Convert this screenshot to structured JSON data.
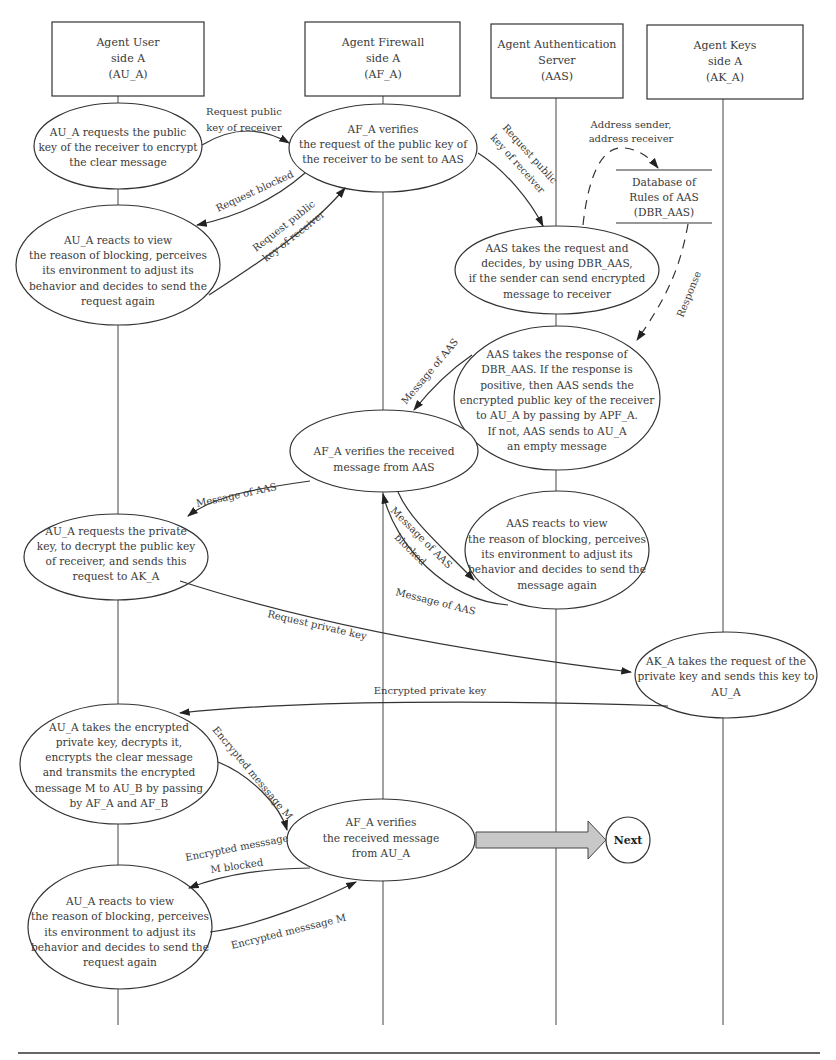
{
  "agents": [
    {
      "id": "AU_A",
      "lines": [
        "Agent User",
        "side A",
        "(AU_A)"
      ]
    },
    {
      "id": "AF_A",
      "lines": [
        "Agent Firewall",
        "side A",
        "(AF_A)"
      ]
    },
    {
      "id": "AAS",
      "lines": [
        "Agent Authentication",
        "Server",
        "(AAS)"
      ]
    },
    {
      "id": "AK_A",
      "lines": [
        "Agent Keys",
        "side A",
        "(AK_A)"
      ]
    }
  ],
  "database": {
    "lines": [
      "Database of",
      "Rules of AAS",
      "(DBR_AAS)"
    ],
    "input_label": [
      "Address sender,",
      "address receiver"
    ],
    "output_label": "Response"
  },
  "nodes": [
    {
      "id": "au_request_public_key",
      "lines": [
        "AU_A requests the public",
        "key of the receiver to encrypt",
        "the clear message"
      ]
    },
    {
      "id": "af_verify_request",
      "lines": [
        "AF_A verifies",
        "the request of the public key of",
        "the receiver to be sent to AAS"
      ]
    },
    {
      "id": "au_react_blocking_1",
      "lines": [
        "AU_A reacts to view",
        "the reason of blocking, perceives",
        "its environment to adjust its",
        "behavior and decides to send the",
        "request again"
      ]
    },
    {
      "id": "aas_take_request",
      "lines": [
        "AAS takes the request and",
        "decides, by using DBR_AAS,",
        "if the sender can send encrypted",
        "message to receiver"
      ]
    },
    {
      "id": "aas_take_response",
      "lines": [
        "AAS takes the response of",
        "DBR_AAS. If the response is",
        "positive, then AAS sends the",
        "encrypted public key of the receiver",
        "to AU_A by passing by APF_A.",
        "If not, AAS sends to AU_A",
        "an empty message"
      ]
    },
    {
      "id": "af_verify_aas_message",
      "lines": [
        "AF_A verifies the received",
        "message from AAS"
      ]
    },
    {
      "id": "au_request_private_key",
      "lines": [
        "AU_A requests the private",
        "key, to decrypt the public key",
        "of receiver, and sends this",
        "request to AK_A"
      ]
    },
    {
      "id": "aas_react_blocking",
      "lines": [
        "AAS reacts to view",
        "the reason of blocking, perceives",
        "its environment to adjust its",
        "behavior and decides to send the",
        "message again"
      ]
    },
    {
      "id": "ak_send_private_key",
      "lines": [
        "AK_A takes the request of the",
        "private key and sends this key to",
        "AU_A"
      ]
    },
    {
      "id": "au_encrypt_transmit",
      "lines": [
        "AU_A takes the encrypted",
        "private key, decrypts it,",
        "encrypts the clear message",
        "and transmits the encrypted",
        "message M to AU_B by passing",
        "by AF_A and AF_B"
      ]
    },
    {
      "id": "af_verify_au_message",
      "lines": [
        "AF_A verifies",
        "the received message",
        "from AU_A"
      ]
    },
    {
      "id": "au_react_blocking_2",
      "lines": [
        "AU_A reacts to view",
        "the reason of blocking, perceives",
        "its environment to adjust its",
        "behavior and decides to send the",
        "request again"
      ]
    }
  ],
  "edges": [
    {
      "id": "e1",
      "lines": [
        "Request public",
        "key of receiver"
      ]
    },
    {
      "id": "e2",
      "lines": [
        "Request blocked"
      ]
    },
    {
      "id": "e3",
      "lines": [
        "Request public",
        "key of receiver"
      ]
    },
    {
      "id": "e4",
      "lines": [
        "Request public",
        "key of receiver"
      ]
    },
    {
      "id": "e5",
      "lines": [
        "Message of AAS"
      ]
    },
    {
      "id": "e6",
      "lines": [
        "Message of AAS"
      ]
    },
    {
      "id": "e7",
      "lines": [
        "Message of AAS",
        "blocked"
      ]
    },
    {
      "id": "e8",
      "lines": [
        "Message of AAS"
      ]
    },
    {
      "id": "e9",
      "lines": [
        "Request private key"
      ]
    },
    {
      "id": "e10",
      "lines": [
        "Encrypted private key"
      ]
    },
    {
      "id": "e11",
      "lines": [
        "Encrypted messsage M"
      ]
    },
    {
      "id": "e12",
      "lines": [
        "Encrypted messsage",
        "M blocked"
      ]
    },
    {
      "id": "e13",
      "lines": [
        "Encrypted messsage M"
      ]
    }
  ],
  "next": {
    "label": "Next"
  },
  "colors": {
    "stroke": "#333333",
    "arrow_fill": "#c8c8c8",
    "text": "#3a3a3a"
  }
}
